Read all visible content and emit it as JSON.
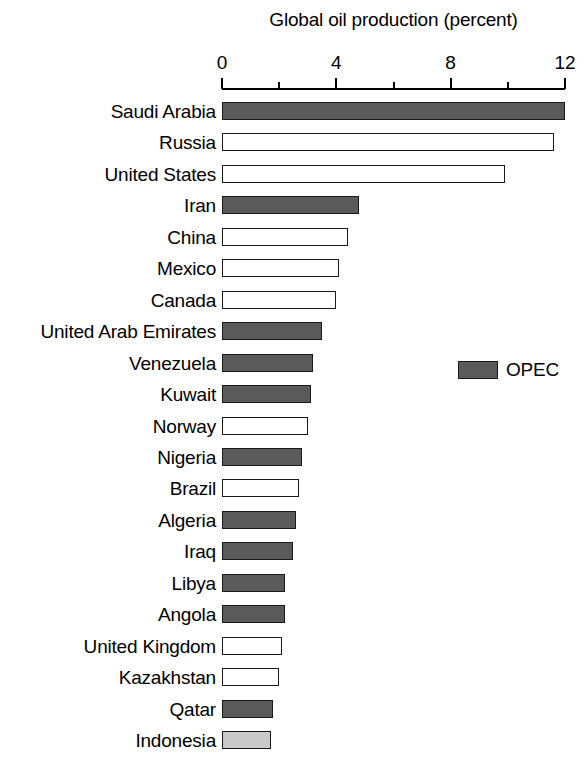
{
  "chart_data": {
    "type": "bar",
    "orientation": "horizontal",
    "title": "Global oil production (percent)",
    "xlabel": "",
    "ylabel": "",
    "xlim": [
      0,
      12
    ],
    "xticks": [
      0,
      4,
      8,
      12
    ],
    "xtick_labels": [
      "0",
      "4",
      "8",
      "12"
    ],
    "minor_xticks": [
      2,
      6,
      10
    ],
    "grid": false,
    "categories": [
      "Saudi Arabia",
      "Russia",
      "United States",
      "Iran",
      "China",
      "Mexico",
      "Canada",
      "United Arab Emirates",
      "Venezuela",
      "Kuwait",
      "Norway",
      "Nigeria",
      "Brazil",
      "Algeria",
      "Iraq",
      "Libya",
      "Angola",
      "United Kingdom",
      "Kazakhstan",
      "Qatar",
      "Indonesia"
    ],
    "values": [
      12.0,
      11.6,
      9.9,
      4.8,
      4.4,
      4.1,
      4.0,
      3.5,
      3.2,
      3.1,
      3.0,
      2.8,
      2.7,
      2.6,
      2.5,
      2.2,
      2.2,
      2.1,
      2.0,
      1.8,
      1.7
    ],
    "groups": [
      "opec",
      "non-opec",
      "non-opec",
      "opec",
      "non-opec",
      "non-opec",
      "non-opec",
      "opec",
      "opec",
      "opec",
      "non-opec",
      "opec",
      "non-opec",
      "opec",
      "opec",
      "opec",
      "opec",
      "non-opec",
      "non-opec",
      "opec",
      "other"
    ],
    "legend": {
      "position": "middle-right",
      "entries": [
        {
          "label": "OPEC",
          "group": "opec",
          "color": "#5a5a5a"
        }
      ]
    },
    "colors": {
      "opec": "#5a5a5a",
      "non-opec": "#ffffff",
      "other": "#c9c9c9",
      "outline": "#1a1a1a",
      "text": "#000000",
      "background": "#ffffff"
    }
  }
}
